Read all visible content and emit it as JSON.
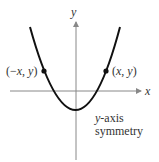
{
  "diagram": {
    "axes": {
      "x_label": "x",
      "y_label": "y"
    },
    "points": {
      "left": {
        "label_open": "(−",
        "label_x": "x",
        "label_comma": ", ",
        "label_y": "y",
        "label_close": ")"
      },
      "right": {
        "label_open": "(",
        "label_x": "x",
        "label_comma": ", ",
        "label_y": "y",
        "label_close": ")"
      }
    },
    "caption": {
      "line1_var": "y",
      "line1_rest": "-axis",
      "line2": "symmetry"
    },
    "colors": {
      "curve": "#111111",
      "axis": "#888888",
      "text": "#333333"
    }
  }
}
